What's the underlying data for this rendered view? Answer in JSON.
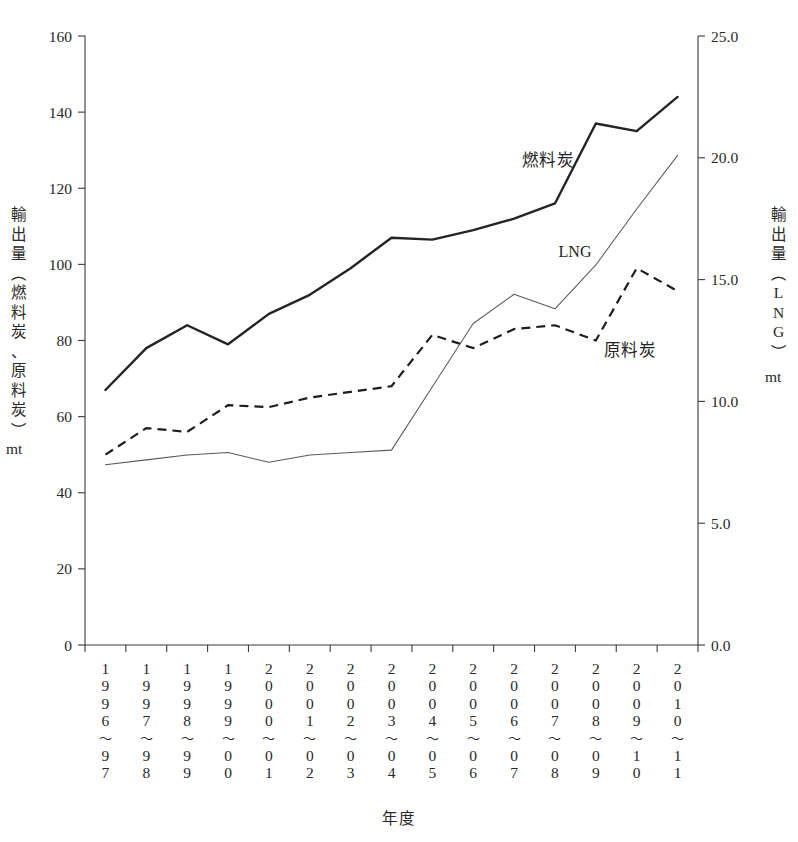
{
  "chart_data": {
    "type": "line",
    "title": "",
    "xlabel": "年度",
    "ylabel": "輸出量（燃料炭、原料炭）mt",
    "y2label": "輸出量（LNG）mt",
    "ylim": [
      0,
      160
    ],
    "y2lim": [
      0.0,
      25.0
    ],
    "grid": false,
    "legend_position": "inline-annotations",
    "categories": [
      "1996~97",
      "1997~98",
      "1998~99",
      "1999~00",
      "2000~01",
      "2001~02",
      "2002~03",
      "2003~04",
      "2004~05",
      "2005~06",
      "2006~07",
      "2007~08",
      "2008~09",
      "2009~10",
      "2010~11"
    ],
    "category_lines": [
      [
        "1",
        "9",
        "9",
        "6",
        "~",
        "9",
        "7"
      ],
      [
        "1",
        "9",
        "9",
        "7",
        "~",
        "9",
        "8"
      ],
      [
        "1",
        "9",
        "9",
        "8",
        "~",
        "9",
        "9"
      ],
      [
        "1",
        "9",
        "9",
        "9",
        "~",
        "0",
        "0"
      ],
      [
        "2",
        "0",
        "0",
        "0",
        "~",
        "0",
        "1"
      ],
      [
        "2",
        "0",
        "0",
        "1",
        "~",
        "0",
        "2"
      ],
      [
        "2",
        "0",
        "0",
        "2",
        "~",
        "0",
        "3"
      ],
      [
        "2",
        "0",
        "0",
        "3",
        "~",
        "0",
        "4"
      ],
      [
        "2",
        "0",
        "0",
        "4",
        "~",
        "0",
        "5"
      ],
      [
        "2",
        "0",
        "0",
        "5",
        "~",
        "0",
        "6"
      ],
      [
        "2",
        "0",
        "0",
        "6",
        "~",
        "0",
        "7"
      ],
      [
        "2",
        "0",
        "0",
        "7",
        "~",
        "0",
        "8"
      ],
      [
        "2",
        "0",
        "0",
        "8",
        "~",
        "0",
        "9"
      ],
      [
        "2",
        "0",
        "0",
        "9",
        "~",
        "1",
        "0"
      ],
      [
        "2",
        "0",
        "1",
        "0",
        "~",
        "1",
        "1"
      ]
    ],
    "y_ticks": [
      0,
      20,
      40,
      60,
      80,
      100,
      120,
      140,
      160
    ],
    "y_tick_labels": [
      "0",
      "20",
      "40",
      "60",
      "80",
      "100",
      "120",
      "140",
      "160"
    ],
    "y2_ticks": [
      0.0,
      5.0,
      10.0,
      15.0,
      20.0,
      25.0
    ],
    "y2_tick_labels": [
      "0.0",
      "5.0",
      "10.0",
      "15.0",
      "20.0",
      "25.0"
    ],
    "series": [
      {
        "name": "燃料炭",
        "axis": "left",
        "style": "solid-thick",
        "color": "#242424",
        "values": [
          67,
          78,
          84,
          79,
          87,
          92,
          99,
          107,
          106.5,
          109,
          112,
          116,
          137,
          135,
          144
        ]
      },
      {
        "name": "原料炭",
        "axis": "left",
        "style": "dashed",
        "color": "#1e1e1e",
        "values": [
          50,
          57,
          56,
          63,
          62.5,
          65,
          66.5,
          68,
          81.5,
          78,
          83,
          84,
          80,
          99,
          93
        ]
      },
      {
        "name": "LNG",
        "axis": "right",
        "style": "solid-thin",
        "color": "#5a5a5a",
        "values": [
          7.4,
          7.6,
          7.8,
          7.9,
          7.5,
          7.8,
          7.9,
          8.0,
          10.6,
          13.2,
          14.4,
          13.8,
          15.6,
          17.9,
          20.1
        ]
      }
    ],
    "annotations": [
      {
        "text": "燃料炭",
        "for": "thermal-coal"
      },
      {
        "text": "LNG",
        "for": "lng"
      },
      {
        "text": "原料炭",
        "for": "coking-coal"
      }
    ]
  },
  "axis_titles": {
    "left": {
      "chars": [
        "輸",
        "出",
        "量",
        "（",
        "燃",
        "料",
        "炭",
        "、",
        "原",
        "料",
        "炭",
        "）"
      ],
      "unit": "mt"
    },
    "right": {
      "chars": [
        "輸",
        "出",
        "量",
        "（",
        "L",
        "N",
        "G",
        "）"
      ],
      "unit": "mt"
    },
    "bottom": "年度"
  }
}
